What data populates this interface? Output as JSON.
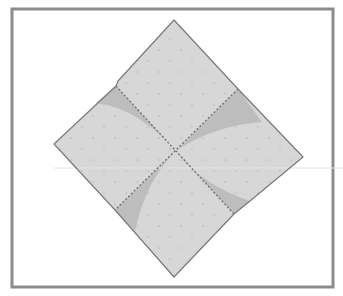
{
  "diagram": {
    "type": "origami-step",
    "colors": {
      "background": "#ffffff",
      "frame": "#8c8c8c",
      "paper": "#d7d7d7",
      "paper_shadow": "#bdbdbd",
      "outline": "#7a7a7a",
      "crease": "#6e6e6e",
      "dots": "#c8c8c8",
      "faint_line": "#e4e4e4"
    },
    "frame": {
      "x": 12,
      "y": 9,
      "width": 321,
      "height": 278,
      "stroke_width": 3
    },
    "paper_outline": [
      [
        174,
        20
      ],
      [
        238,
        89
      ],
      [
        303,
        157
      ],
      [
        250,
        201
      ],
      [
        234,
        214
      ],
      [
        174,
        277
      ],
      [
        115,
        210
      ],
      [
        54,
        144
      ],
      [
        116,
        86
      ],
      [
        118,
        81
      ]
    ],
    "center": [
      176,
      151
    ],
    "creases": [
      {
        "name": "crease-upper-left-to-lower-right",
        "from": [
          116,
          86
        ],
        "to": [
          234,
          214
        ],
        "style": "dotted"
      },
      {
        "name": "crease-upper-right-to-lower-left",
        "from": [
          238,
          89
        ],
        "to": [
          115,
          210
        ],
        "style": "dotted"
      }
    ],
    "shaded_wedges": [
      {
        "name": "wedge-upper-left",
        "path": "M116 86 L176 151 Q138 108 96 103 Z"
      },
      {
        "name": "wedge-upper-right",
        "path": "M238 89 L176 151 Q212 126 262 122 Z"
      },
      {
        "name": "wedge-lower-left",
        "path": "M115 210 L176 151 Q146 180 135 231 Z"
      },
      {
        "name": "wedge-lower-right",
        "path": "M234 214 L176 151 Q200 184 250 201 Z"
      }
    ],
    "faint_horizontal_line": {
      "y": 168,
      "x1": 54,
      "x2": 343
    }
  }
}
